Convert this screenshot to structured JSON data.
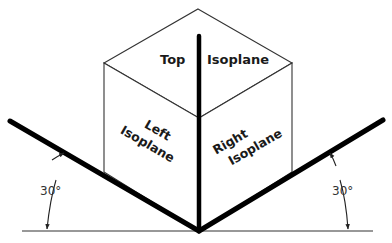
{
  "diagram": {
    "labels": {
      "top_word1": "Top",
      "top_word2": "Isoplane",
      "left_word1": "Left",
      "left_word2": "Isoplane",
      "right_word1": "Right",
      "right_word2": "Isoplane",
      "left_angle": "30°",
      "right_angle": "30°"
    },
    "colors": {
      "thick_line": "#000000",
      "thin_line": "#333333",
      "text": "#1a1a1a",
      "background": "#ffffff"
    }
  }
}
